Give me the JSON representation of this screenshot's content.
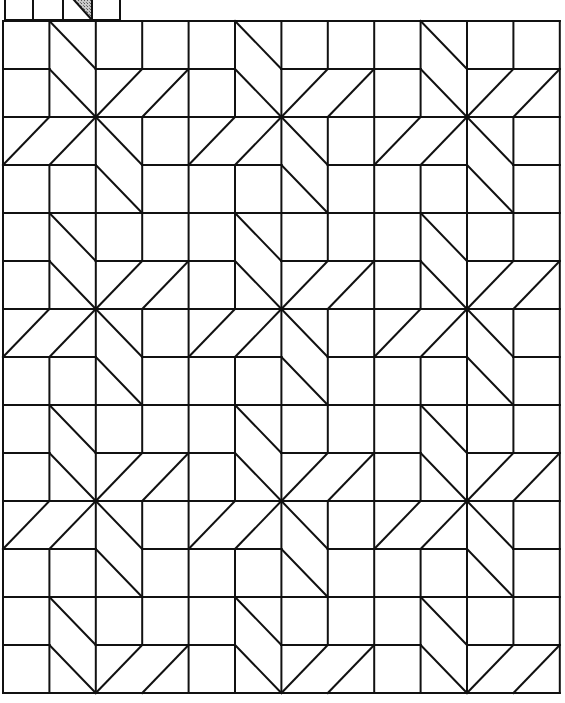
{
  "pattern": {
    "name": "eight-point star quilt block grid",
    "stroke_color": "#111111",
    "fill_color": "#ffffff",
    "shade_color": "#9a9a9a",
    "stroke_width": 2,
    "grid": {
      "origin_x": 3,
      "origin_y": 21,
      "cols": 12,
      "rows": 14,
      "cell_w": 46.4,
      "cell_h": 48
    },
    "block_period": 4,
    "star_center_in_block": [
      2,
      2
    ],
    "block_missing_segments": [
      {
        "type": "h",
        "y": 1,
        "x1": 1,
        "x2": 2
      },
      {
        "type": "v",
        "x": 3,
        "y1": 1,
        "y2": 2
      },
      {
        "type": "v",
        "x": 1,
        "y1": 2,
        "y2": 3
      },
      {
        "type": "h",
        "y": 3,
        "x1": 2,
        "x2": 3
      }
    ],
    "block_diagonals": [
      [
        1,
        0,
        2,
        1
      ],
      [
        1,
        1,
        2,
        2
      ],
      [
        2,
        2,
        3,
        1
      ],
      [
        3,
        2,
        4,
        1
      ],
      [
        0,
        3,
        1,
        2
      ],
      [
        1,
        3,
        2,
        2
      ],
      [
        2,
        2,
        3,
        3
      ],
      [
        2,
        3,
        3,
        4
      ]
    ]
  },
  "header_strip": {
    "box_edges_x": [
      5,
      33,
      63,
      92,
      120
    ],
    "y_top": 0,
    "y_bottom": 20,
    "shaded_box_index": 2,
    "shaded_triangle": [
      [
        74,
        0
      ],
      [
        92,
        0
      ],
      [
        92,
        20
      ]
    ]
  }
}
